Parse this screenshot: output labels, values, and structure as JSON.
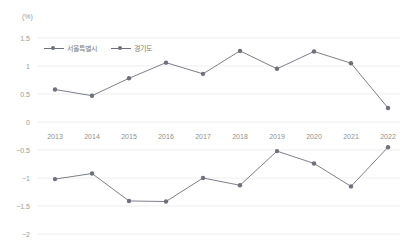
{
  "chart_data": {
    "type": "line",
    "title": "",
    "subtitle": "",
    "unit_label": "(%)",
    "xlabel": "",
    "ylabel": "",
    "categories": [
      "2013",
      "2014",
      "2015",
      "2016",
      "2017",
      "2018",
      "2019",
      "2020",
      "2021",
      "2022"
    ],
    "series": [
      {
        "name": "서울특별시",
        "color": "#6f6f7d",
        "values": [
          0.58,
          0.47,
          0.78,
          1.06,
          0.86,
          1.27,
          0.95,
          1.26,
          1.05,
          0.25
        ]
      },
      {
        "name": "경기도",
        "color": "#6f6f7d",
        "values": [
          -1.02,
          -0.92,
          -1.41,
          -1.42,
          -1.0,
          -1.13,
          -0.52,
          -0.74,
          -1.15,
          -0.45
        ]
      }
    ],
    "ylim": [
      -2,
      1.5
    ],
    "yticks": [
      1.5,
      1,
      0.5,
      0,
      -0.5,
      -1,
      -1.5,
      -2
    ],
    "ytick_labels": [
      "1.5",
      "1",
      "0.5",
      "0",
      "−0.5",
      "−1",
      "−1.5",
      "−2"
    ],
    "grid": true,
    "grid_color": "#e8e8ea",
    "legend_position": "top-left",
    "xtick_position": "between 0 and -0.5 gridlines",
    "background": "#ffffff"
  },
  "legend": {
    "items": [
      {
        "label": "서울특별시"
      },
      {
        "label": "경기도"
      }
    ]
  }
}
